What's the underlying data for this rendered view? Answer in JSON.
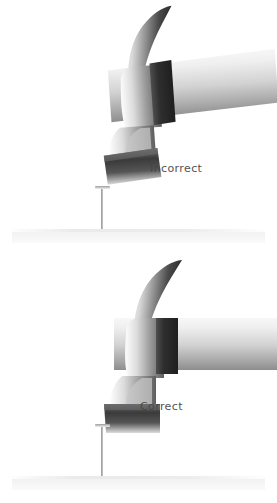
{
  "figure": {
    "background_color": "#ffffff",
    "width": 277,
    "height": 503,
    "style": "grayscale-airbrush-illustration"
  },
  "panels": [
    {
      "id": "top",
      "label": "Incorrect",
      "label_x": 150,
      "label_y": 162,
      "demonstrates": "hammer face strikes the nail at an angle",
      "hammer": {
        "tilt_degrees": -4,
        "head_x": 62,
        "head_y": 18,
        "handle_extends_off_right_edge": true,
        "face_contact": "angled"
      },
      "nail": {
        "x": 101,
        "head_y": 186,
        "tip_y": 237,
        "head_width": 15,
        "visible_shaft_px": 51,
        "orientation": "vertical"
      },
      "surface": {
        "x": 12,
        "y": 229,
        "width": 253,
        "height": 14,
        "color": "#f2f2f2"
      }
    },
    {
      "id": "bottom",
      "label": "Correct",
      "label_x": 140,
      "label_y": 400,
      "demonstrates": "hammer face strikes the nail squarely and level",
      "hammer": {
        "tilt_degrees": 0,
        "head_x": 62,
        "head_y": 262,
        "handle_extends_off_right_edge": true,
        "face_contact": "flat"
      },
      "nail": {
        "x": 101,
        "head_y": 424,
        "tip_y": 484,
        "head_width": 15,
        "visible_shaft_px": 60,
        "orientation": "vertical"
      },
      "surface": {
        "x": 12,
        "y": 476,
        "width": 253,
        "height": 14,
        "color": "#f2f2f2"
      }
    }
  ],
  "palette": {
    "background": "#ffffff",
    "label_text": "#454545",
    "metal_highlight": "#f4f4f4",
    "metal_light": "#d4d4d4",
    "metal_mid": "#9a9a9a",
    "metal_dark": "#3a3a3a",
    "metal_darkest": "#242424",
    "handle_light": "#ededed",
    "handle_mid": "#bdbdbd",
    "handle_shadow": "#8f8f8f",
    "surface_band": "#f2f2f2",
    "nail_metal": "#8d8d8d"
  }
}
